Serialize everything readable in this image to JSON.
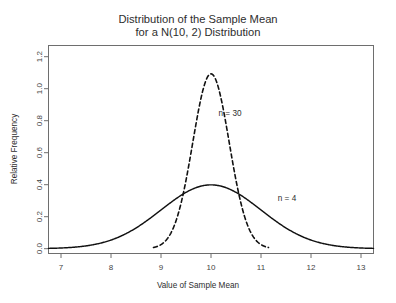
{
  "chart_data": {
    "type": "line",
    "title": "Distribution of the Sample Mean",
    "subtitle": "for a N(10, 2) Distribution",
    "title_lines": [
      "Distribution of the Sample Mean",
      "for a N(10, 2) Distribution"
    ],
    "xlabel": "Value of Sample Mean",
    "ylabel": "Relative Frequency",
    "xlim": [
      6.75,
      13.25
    ],
    "ylim": [
      -0.03,
      1.27
    ],
    "xticks": [
      7,
      8,
      9,
      10,
      11,
      12,
      13
    ],
    "xtick_labels": [
      "7",
      "8",
      "9",
      "10",
      "11",
      "12",
      "13"
    ],
    "yticks": [
      0.0,
      0.2,
      0.4,
      0.6,
      0.8,
      1.0,
      1.2
    ],
    "ytick_labels": [
      "0.0",
      "0.2",
      "0.4",
      "0.6",
      "0.8",
      "1.0",
      "1.2"
    ],
    "grid": false,
    "legend_position": "inline-annotations",
    "population": {
      "mean": 10,
      "sd": 2
    },
    "series": [
      {
        "name": "n = 4",
        "style": "solid",
        "color": "#111111",
        "distribution": "normal",
        "mean": 10,
        "sd": 1.0,
        "peak": 0.399,
        "x_range": [
          6.75,
          13.25
        ],
        "label": "n = 4",
        "label_x": 11.52,
        "label_y": 0.3,
        "x": [
          6.75,
          7.0,
          7.25,
          7.5,
          7.75,
          8.0,
          8.25,
          8.5,
          8.75,
          9.0,
          9.25,
          9.5,
          9.75,
          10.0,
          10.25,
          10.5,
          10.75,
          11.0,
          11.25,
          11.5,
          11.75,
          12.0,
          12.25,
          12.5,
          12.75,
          13.0,
          13.25
        ],
        "y": [
          0.0091,
          0.0044,
          0.0088,
          0.0175,
          0.0325,
          0.054,
          0.0863,
          0.1295,
          0.1826,
          0.242,
          0.3011,
          0.3521,
          0.3867,
          0.3989,
          0.3867,
          0.3521,
          0.3011,
          0.242,
          0.1826,
          0.1295,
          0.0863,
          0.054,
          0.0325,
          0.0175,
          0.0088,
          0.0044,
          0.0091
        ]
      },
      {
        "name": "n = 30",
        "style": "dashed",
        "color": "#111111",
        "distribution": "normal",
        "mean": 10,
        "sd": 0.365,
        "peak": 1.093,
        "x_range": [
          8.85,
          11.15
        ],
        "label": "n = 30",
        "label_x": 10.38,
        "label_y": 0.83,
        "x": [
          8.85,
          8.95,
          9.05,
          9.15,
          9.25,
          9.35,
          9.45,
          9.55,
          9.65,
          9.75,
          9.85,
          9.95,
          10.05,
          10.15,
          10.25,
          10.35,
          10.45,
          10.55,
          10.65,
          10.75,
          10.85,
          10.95,
          11.05,
          11.15
        ],
        "y": [
          0.0093,
          0.0201,
          0.0405,
          0.0763,
          0.1347,
          0.2229,
          0.3459,
          0.5036,
          0.6873,
          0.8803,
          1.0583,
          1.1937,
          1.1937,
          1.0583,
          0.8803,
          0.6873,
          0.5036,
          0.3459,
          0.2229,
          0.1347,
          0.0763,
          0.0405,
          0.0201,
          0.0093
        ]
      }
    ]
  }
}
